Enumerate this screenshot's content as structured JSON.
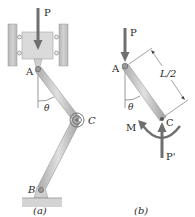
{
  "figure_a": {
    "caption": "(a)",
    "labels": {
      "force": "P",
      "pin_top": "A",
      "pin_bottom": "B",
      "spring_joint": "C",
      "angle": "θ"
    }
  },
  "figure_b": {
    "caption": "(b)",
    "labels": {
      "force_top": "P",
      "pin_top": "A",
      "joint": "C",
      "angle": "θ",
      "length": "L/2",
      "moment": "M",
      "reaction": "P'"
    }
  },
  "colors": {
    "member": "#c8c8c8",
    "member_edge": "#8a8a8a",
    "arrow": "#6f6f6f",
    "block": "#d9d9d9",
    "wall": "#c4c4c4",
    "ground": "#cfcfcf"
  }
}
